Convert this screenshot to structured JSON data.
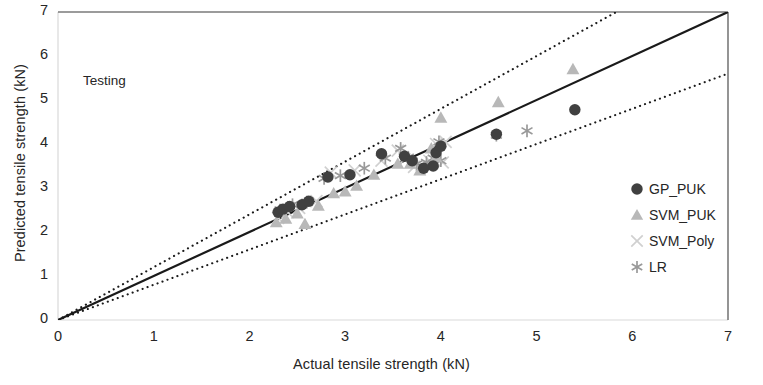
{
  "chart_data": {
    "type": "scatter",
    "title": "",
    "annotation": "Testing",
    "xlabel": "Actual tensile strength (kN)",
    "ylabel": "Predicted tensile strength (kN)",
    "xlim": [
      0,
      7
    ],
    "ylim": [
      0,
      7
    ],
    "xticks": [
      0,
      1,
      2,
      3,
      4,
      5,
      6,
      7
    ],
    "yticks": [
      0,
      1,
      2,
      3,
      4,
      5,
      6,
      7
    ],
    "xtick_labels": [
      "0",
      "1",
      "2",
      "3",
      "4",
      "5",
      "6",
      "7"
    ],
    "ytick_labels": [
      "0",
      "1",
      "2",
      "3",
      "4",
      "5",
      "6",
      "7"
    ],
    "grid": false,
    "legend_position": "right-middle",
    "reference_lines": [
      {
        "name": "identity",
        "style": "solid",
        "color": "#1a1a1a",
        "slope": 1.0,
        "intercept": 0
      },
      {
        "name": "upper-bound",
        "style": "dotted",
        "color": "#1a1a1a",
        "slope": 1.2,
        "intercept": 0
      },
      {
        "name": "lower-bound",
        "style": "dotted",
        "color": "#1a1a1a",
        "slope": 0.8,
        "intercept": 0
      }
    ],
    "series": [
      {
        "name": "GP_PUK",
        "marker": "circle",
        "color": "#404040",
        "points": [
          [
            2.3,
            2.45
          ],
          [
            2.35,
            2.52
          ],
          [
            2.42,
            2.58
          ],
          [
            2.55,
            2.62
          ],
          [
            2.62,
            2.7
          ],
          [
            2.82,
            3.25
          ],
          [
            3.05,
            3.3
          ],
          [
            3.38,
            3.78
          ],
          [
            3.62,
            3.72
          ],
          [
            3.7,
            3.62
          ],
          [
            3.82,
            3.45
          ],
          [
            3.92,
            3.5
          ],
          [
            3.95,
            3.8
          ],
          [
            4.0,
            3.95
          ],
          [
            4.58,
            4.22
          ],
          [
            5.4,
            4.78
          ]
        ]
      },
      {
        "name": "SVM_PUK",
        "marker": "triangle",
        "color": "#b8b8b8",
        "points": [
          [
            2.28,
            2.22
          ],
          [
            2.38,
            2.3
          ],
          [
            2.5,
            2.42
          ],
          [
            2.58,
            2.18
          ],
          [
            2.72,
            2.6
          ],
          [
            2.88,
            2.88
          ],
          [
            3.0,
            2.92
          ],
          [
            3.12,
            3.05
          ],
          [
            3.3,
            3.3
          ],
          [
            3.55,
            3.55
          ],
          [
            3.68,
            3.55
          ],
          [
            3.78,
            3.4
          ],
          [
            3.9,
            3.9
          ],
          [
            3.95,
            3.7
          ],
          [
            4.0,
            4.6
          ],
          [
            4.6,
            4.95
          ],
          [
            5.38,
            5.7
          ]
        ]
      },
      {
        "name": "SVM_Poly",
        "marker": "cross",
        "color": "#d0d0d0",
        "points": [
          [
            2.3,
            2.32
          ],
          [
            2.4,
            2.45
          ],
          [
            2.52,
            2.55
          ],
          [
            2.7,
            2.7
          ],
          [
            2.85,
            3.35
          ],
          [
            3.1,
            3.4
          ],
          [
            3.38,
            3.62
          ],
          [
            3.55,
            3.85
          ],
          [
            3.62,
            3.65
          ],
          [
            3.72,
            3.48
          ],
          [
            3.8,
            3.52
          ],
          [
            3.88,
            3.62
          ],
          [
            3.95,
            4.0
          ],
          [
            4.02,
            3.58
          ],
          [
            4.05,
            4.05
          ]
        ]
      },
      {
        "name": "LR",
        "marker": "asterisk",
        "color": "#999999",
        "points": [
          [
            2.32,
            2.5
          ],
          [
            2.45,
            2.62
          ],
          [
            2.6,
            2.68
          ],
          [
            2.78,
            3.22
          ],
          [
            2.95,
            3.28
          ],
          [
            3.2,
            3.45
          ],
          [
            3.42,
            3.68
          ],
          [
            3.58,
            3.9
          ],
          [
            3.66,
            3.7
          ],
          [
            3.75,
            3.55
          ],
          [
            3.85,
            3.58
          ],
          [
            3.92,
            3.68
          ],
          [
            3.98,
            4.05
          ],
          [
            4.0,
            3.62
          ],
          [
            4.58,
            4.2
          ],
          [
            4.9,
            4.3
          ]
        ]
      }
    ]
  },
  "legend": {
    "items": [
      {
        "label": "GP_PUK",
        "marker": "circle",
        "color": "#404040"
      },
      {
        "label": "SVM_PUK",
        "marker": "triangle",
        "color": "#b8b8b8"
      },
      {
        "label": "SVM_Poly",
        "marker": "cross",
        "color": "#d0d0d0"
      },
      {
        "label": "LR",
        "marker": "asterisk",
        "color": "#999999"
      }
    ]
  }
}
